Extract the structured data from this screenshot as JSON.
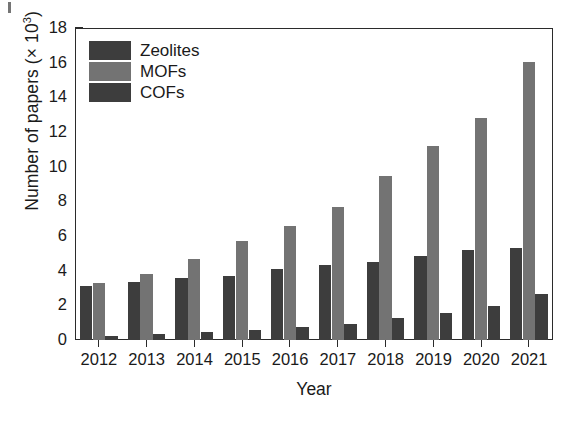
{
  "chart_data": {
    "type": "bar",
    "title": "",
    "xlabel": "Year",
    "ylabel": "Number of papers (× 10³)",
    "ylabel_base": "Number of papers (× 10",
    "ylabel_exp": "3",
    "ylabel_tail": ")",
    "categories": [
      "2012",
      "2013",
      "2014",
      "2015",
      "2016",
      "2017",
      "2018",
      "2019",
      "2020",
      "2021"
    ],
    "series": [
      {
        "name": "Zeolites",
        "color": "#3d3d3d",
        "values": [
          3.1,
          3.35,
          3.6,
          3.7,
          4.1,
          4.3,
          4.5,
          4.85,
          5.2,
          5.3
        ]
      },
      {
        "name": "MOFs",
        "color": "#737373",
        "values": [
          3.3,
          3.8,
          4.7,
          5.7,
          6.55,
          7.65,
          9.45,
          11.2,
          12.8,
          16.05
        ]
      },
      {
        "name": "COFs",
        "color": "#3d3d3d",
        "values": [
          0.25,
          0.35,
          0.45,
          0.6,
          0.75,
          0.95,
          1.25,
          1.55,
          1.95,
          2.65
        ]
      }
    ],
    "ylim": [
      0,
      18
    ],
    "y_major_ticks": [
      0,
      2,
      4,
      6,
      8,
      10,
      12,
      14,
      16,
      18
    ],
    "y_minor_ticks": [
      1,
      3,
      5,
      7,
      9,
      11,
      13,
      15,
      17
    ],
    "y_tick_labels": [
      "0",
      "2",
      "4",
      "6",
      "8",
      "10",
      "12",
      "14",
      "16",
      "18"
    ],
    "grid": false,
    "legend_position": "top-left",
    "legend_entries": [
      "Zeolites",
      "MOFs",
      "COFs"
    ],
    "axis_color": "#2b2b2b",
    "background": "#ffffff"
  }
}
